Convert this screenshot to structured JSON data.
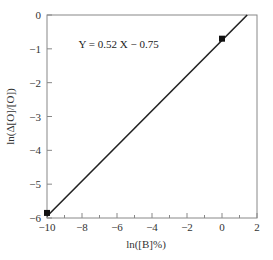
{
  "chart_data": {
    "type": "line",
    "title": "",
    "xlabel": "ln([B]%)",
    "ylabel": "ln(Δ[O]/[O])",
    "xlim": [
      -10,
      2
    ],
    "ylim": [
      -6,
      0
    ],
    "xticks": [
      -10,
      -8,
      -6,
      -4,
      -2,
      0,
      2
    ],
    "xtick_labels": [
      "−10",
      "−8",
      "−6",
      "−4",
      "−2",
      "0",
      "2"
    ],
    "yticks": [
      0,
      -1,
      -2,
      -3,
      -4,
      -5,
      -6
    ],
    "ytick_labels": [
      "0",
      "−1",
      "−2",
      "−3",
      "−4",
      "−5",
      "−6"
    ],
    "grid": false,
    "legend": null,
    "annotations": [
      {
        "text": "Y = 0.52 X − 0.75",
        "x": -8.2,
        "y": -0.85
      }
    ],
    "series": [
      {
        "name": "fit",
        "kind": "line",
        "slope": 0.52,
        "intercept": -0.75,
        "x": [
          -10,
          1.44
        ],
        "y": [
          -5.95,
          0
        ]
      },
      {
        "name": "data",
        "kind": "scatter",
        "marker": "square",
        "x": [
          -10,
          0
        ],
        "y": [
          -5.85,
          -0.7
        ]
      }
    ]
  },
  "colors": {
    "line": "#222222",
    "axis": "#888888",
    "marker": "#111111"
  }
}
